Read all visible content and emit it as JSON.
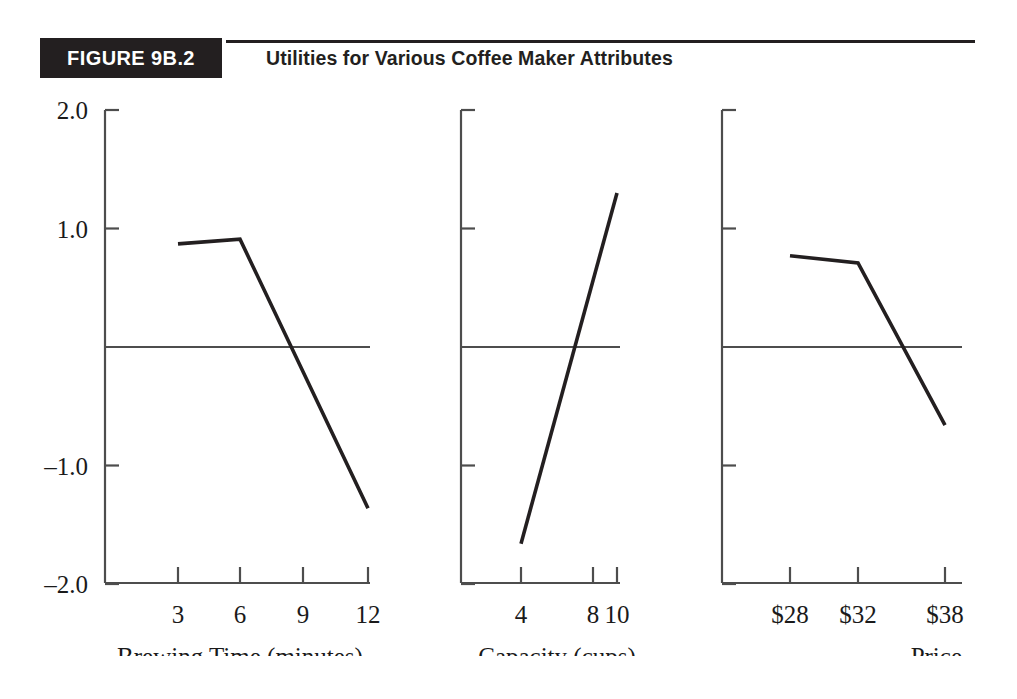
{
  "header": {
    "badge_label": "FIGURE 9B.2",
    "title": "Utilities for Various Coffee Maker Attributes",
    "badge_color": "#231f20",
    "badge_text_color": "#ffffff",
    "rule_color": "#231f20"
  },
  "axis": {
    "y_tick_labels": [
      "2.0",
      "1.0",
      "-1.0",
      "-2.0"
    ],
    "y_tick_values": [
      2.0,
      1.0,
      -1.0,
      -2.0
    ],
    "zero_line_label": ""
  },
  "panels": [
    {
      "name": "brewing-time",
      "xlabel": "Brewing Time (minutes)",
      "xlabel_align": "center",
      "categories": [
        "3",
        "6",
        "9",
        "12"
      ],
      "point_categories": [
        "3",
        "6",
        "12"
      ],
      "values": [
        0.87,
        0.91,
        -1.36
      ]
    },
    {
      "name": "capacity",
      "xlabel": "Capacity (cups)",
      "xlabel_align": "center",
      "categories": [
        "4",
        "8",
        "10"
      ],
      "point_categories": [
        "4",
        "10"
      ],
      "values": [
        -1.66,
        1.3
      ]
    },
    {
      "name": "price",
      "xlabel": "Price",
      "xlabel_align": "right",
      "categories": [
        "$28",
        "$32",
        "$38"
      ],
      "point_categories": [
        "$28",
        "$32",
        "$38"
      ],
      "values": [
        0.77,
        0.71,
        -0.66
      ]
    }
  ],
  "chart_data": {
    "type": "line",
    "title": "Utilities for Various Coffee Maker Attributes",
    "subtitle": "FIGURE 9B.2",
    "ylabel": "Utility",
    "ylim": [
      -2.0,
      2.0
    ],
    "yticks": [
      2.0,
      1.0,
      -1.0,
      -2.0
    ],
    "grid": false,
    "legend": "none",
    "zero_reference_line": 0.0,
    "panels": [
      {
        "xlabel": "Brewing Time (minutes)",
        "tick_labels": [
          "3",
          "6",
          "9",
          "12"
        ],
        "x": [
          3,
          6,
          12
        ],
        "y": [
          0.87,
          0.91,
          -1.36
        ]
      },
      {
        "xlabel": "Capacity (cups)",
        "tick_labels": [
          "4",
          "8",
          "10"
        ],
        "x": [
          4,
          10
        ],
        "y": [
          -1.66,
          1.3
        ]
      },
      {
        "xlabel": "Price",
        "tick_labels": [
          "$28",
          "$32",
          "$38"
        ],
        "x": [
          28,
          32,
          38
        ],
        "y": [
          0.77,
          0.71,
          -0.66
        ]
      }
    ]
  }
}
